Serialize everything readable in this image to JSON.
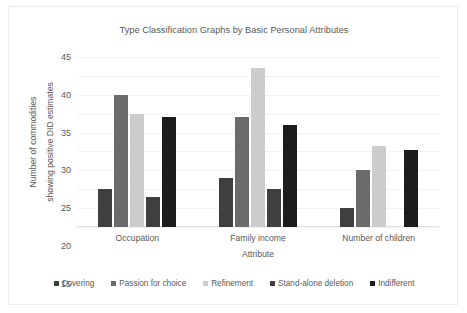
{
  "chart_data": {
    "type": "bar",
    "title": "Type Classification Graphs by Basic Personal Attributes",
    "xlabel": "Attribute",
    "ylabel_line1": "Number of commodities",
    "ylabel_line2": "showing positive DID estimates",
    "categories": [
      "Occupation",
      "Family income",
      "Number of children"
    ],
    "ylim": [
      0,
      45
    ],
    "yticks": [
      0,
      5,
      10,
      15,
      20,
      25,
      30,
      35,
      40,
      45
    ],
    "grid": true,
    "legend_position": "bottom",
    "series": [
      {
        "name": "Covering",
        "color": "#3f3f3f",
        "values": [
          10,
          13,
          5
        ]
      },
      {
        "name": "Passion for choice",
        "color": "#6b6b6b",
        "values": [
          35,
          29,
          15
        ]
      },
      {
        "name": "Refinement",
        "color": "#cccccc",
        "values": [
          30,
          42,
          21.5
        ]
      },
      {
        "name": "Stand-alone deletion",
        "color": "#404040",
        "values": [
          8,
          10,
          0
        ]
      },
      {
        "name": "Indifferent",
        "color": "#1c1c1c",
        "values": [
          29,
          27,
          20.5
        ]
      }
    ]
  }
}
